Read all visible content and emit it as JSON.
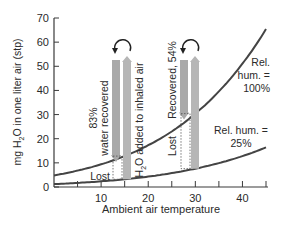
{
  "chart_data": {
    "type": "line",
    "title": "",
    "xlabel": "Ambient air temperature",
    "ylabel": "mg H2O in one liter air (stp)",
    "ylabel_parts": {
      "pre": "mg H",
      "sub": "2",
      "post": "O in one liter air (stp)"
    },
    "xlim": [
      0,
      45
    ],
    "ylim": [
      0,
      70
    ],
    "x_ticks": [
      0,
      5,
      10,
      15,
      20,
      25,
      30,
      35,
      40,
      45
    ],
    "x_tick_labels": [
      {
        "value": 10,
        "label": "10"
      },
      {
        "value": 20,
        "label": "20"
      },
      {
        "value": 30,
        "label": "30"
      },
      {
        "value": 40,
        "label": "40"
      }
    ],
    "y_ticks": [
      {
        "value": 0,
        "label": "0"
      },
      {
        "value": 10,
        "label": "10"
      },
      {
        "value": 20,
        "label": "20"
      },
      {
        "value": 30,
        "label": "30"
      },
      {
        "value": 40,
        "label": "40"
      },
      {
        "value": 50,
        "label": "50"
      },
      {
        "value": 60,
        "label": "60"
      },
      {
        "value": 70,
        "label": "70"
      }
    ],
    "grid": false,
    "series": [
      {
        "name": "Rel. hum. = 100%",
        "label_lines": [
          "Rel.",
          "hum. =",
          "100%"
        ],
        "x": [
          0,
          5,
          10,
          15,
          20,
          25,
          30,
          35,
          40,
          45
        ],
        "values": [
          4.8,
          6.8,
          9.4,
          12.8,
          17.3,
          23.0,
          30.4,
          39.6,
          51.1,
          65.4
        ],
        "color": "#444444"
      },
      {
        "name": "Rel. hum. = 25%",
        "label_lines": [
          "Rel. hum. =",
          "25%"
        ],
        "x": [
          0,
          5,
          10,
          15,
          20,
          25,
          30,
          35,
          40,
          45
        ],
        "values": [
          1.2,
          1.7,
          2.35,
          3.2,
          4.3,
          5.75,
          7.6,
          9.9,
          12.8,
          16.4
        ],
        "color": "#444444"
      }
    ],
    "annotations": [
      {
        "name": "cool-air-exchange",
        "temperature": 15,
        "recovered_label": [
          "83%",
          "water recovered"
        ],
        "added_label": "H2O added to inhaled air",
        "added_label_parts": {
          "pre": "H",
          "sub": "2",
          "post": "O added to inhaled air"
        },
        "lost_label": "Lost",
        "recovered_percent": 83
      },
      {
        "name": "warm-air-exchange",
        "temperature": 30,
        "recovered_label": [
          "Recovered, 54%"
        ],
        "lost_label": "Lost",
        "recovered_percent": 54
      }
    ],
    "colors": {
      "axis": "#3a3a3a",
      "curve": "#444444",
      "arrow_down": "#a9a9a9",
      "arrow_up": "#b6b6b6",
      "text": "#2a2a2a"
    }
  }
}
